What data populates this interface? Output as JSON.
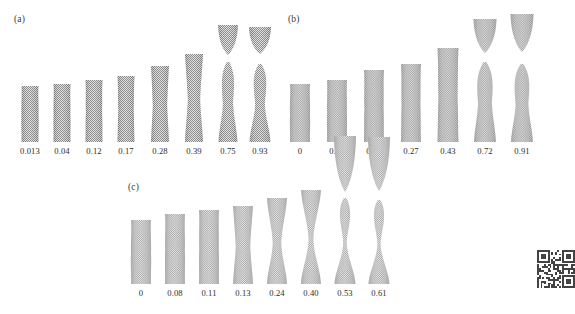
{
  "figure": {
    "type": "molecular-dynamics-snapshot-series",
    "background_color": "#ffffff",
    "atom_color": "#9a9a9a",
    "label_color": "#2b2b2b"
  },
  "panels": [
    {
      "id": "a",
      "label": "(a)",
      "label_x": 14,
      "label_y": 14,
      "baseline_y": 142,
      "snapshots": [
        {
          "strain": "0.013",
          "cx": 30,
          "w": 17,
          "h": 56,
          "neck": 0.0,
          "fractured": false,
          "gap": 0,
          "top_h": 0
        },
        {
          "strain": "0.04",
          "cx": 62,
          "w": 17,
          "h": 58,
          "neck": 0.02,
          "fractured": false,
          "gap": 0,
          "top_h": 0
        },
        {
          "strain": "0.12",
          "cx": 94,
          "w": 17,
          "h": 62,
          "neck": 0.05,
          "fractured": false,
          "gap": 0,
          "top_h": 0
        },
        {
          "strain": "0.17",
          "cx": 126,
          "w": 17,
          "h": 66,
          "neck": 0.1,
          "fractured": false,
          "gap": 0,
          "top_h": 0
        },
        {
          "strain": "0.28",
          "cx": 160,
          "w": 18,
          "h": 76,
          "neck": 0.22,
          "fractured": false,
          "gap": 0,
          "top_h": 0
        },
        {
          "strain": "0.39",
          "cx": 194,
          "w": 18,
          "h": 88,
          "neck": 0.34,
          "fractured": false,
          "gap": 0,
          "top_h": 0
        },
        {
          "strain": "0.75",
          "cx": 228,
          "w": 19,
          "h": 80,
          "neck": 0.5,
          "fractured": true,
          "gap": 7,
          "top_h": 30
        },
        {
          "strain": "0.93",
          "cx": 260,
          "w": 21,
          "h": 78,
          "neck": 0.58,
          "fractured": true,
          "gap": 10,
          "top_h": 27
        }
      ]
    },
    {
      "id": "b",
      "label": "(b)",
      "label_x": 288,
      "label_y": 14,
      "baseline_y": 142,
      "snapshots": [
        {
          "strain": "0",
          "cx": 300,
          "w": 20,
          "h": 58,
          "neck": 0.0,
          "fractured": false,
          "gap": 0,
          "top_h": 0
        },
        {
          "strain": "0.08",
          "cx": 337,
          "w": 20,
          "h": 62,
          "neck": 0.02,
          "fractured": false,
          "gap": 0,
          "top_h": 0
        },
        {
          "strain": "0.19",
          "cx": 374,
          "w": 20,
          "h": 72,
          "neck": 0.05,
          "fractured": false,
          "gap": 0,
          "top_h": 0
        },
        {
          "strain": "0.27",
          "cx": 411,
          "w": 20,
          "h": 78,
          "neck": 0.07,
          "fractured": false,
          "gap": 0,
          "top_h": 0
        },
        {
          "strain": "0.43",
          "cx": 448,
          "w": 21,
          "h": 94,
          "neck": 0.1,
          "fractured": false,
          "gap": 0,
          "top_h": 0
        },
        {
          "strain": "0.72",
          "cx": 485,
          "w": 22,
          "h": 80,
          "neck": 0.4,
          "fractured": true,
          "gap": 9,
          "top_h": 34
        },
        {
          "strain": "0.91",
          "cx": 522,
          "w": 22,
          "h": 78,
          "neck": 0.45,
          "fractured": true,
          "gap": 12,
          "top_h": 38
        }
      ]
    },
    {
      "id": "c",
      "label": "(c)",
      "label_x": 128,
      "label_y": 182,
      "baseline_y": 284,
      "snapshots": [
        {
          "strain": "0",
          "cx": 141,
          "w": 20,
          "h": 64,
          "neck": 0.0,
          "fractured": false,
          "gap": 0,
          "top_h": 0
        },
        {
          "strain": "0.08",
          "cx": 175,
          "w": 20,
          "h": 70,
          "neck": 0.02,
          "fractured": false,
          "gap": 0,
          "top_h": 0
        },
        {
          "strain": "0.11",
          "cx": 209,
          "w": 20,
          "h": 74,
          "neck": 0.03,
          "fractured": false,
          "gap": 0,
          "top_h": 0
        },
        {
          "strain": "0.13",
          "cx": 243,
          "w": 20,
          "h": 78,
          "neck": 0.3,
          "fractured": false,
          "gap": 0,
          "top_h": 0
        },
        {
          "strain": "0.24",
          "cx": 277,
          "w": 20,
          "h": 86,
          "neck": 0.62,
          "fractured": false,
          "gap": 0,
          "top_h": 0
        },
        {
          "strain": "0.40",
          "cx": 311,
          "w": 20,
          "h": 94,
          "neck": 0.82,
          "fractured": false,
          "gap": 0,
          "top_h": 0
        },
        {
          "strain": "0.53",
          "cx": 345,
          "w": 21,
          "h": 86,
          "neck": 0.9,
          "fractured": true,
          "gap": 6,
          "top_h": 56
        },
        {
          "strain": "0.61",
          "cx": 379,
          "w": 21,
          "h": 84,
          "neck": 0.92,
          "fractured": true,
          "gap": 9,
          "top_h": 54
        }
      ]
    }
  ],
  "watermark": {
    "name": "qr-code",
    "x": 537,
    "y": 250,
    "size": 38
  }
}
